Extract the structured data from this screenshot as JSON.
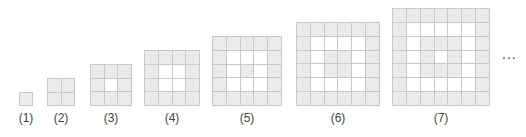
{
  "figures": [
    {
      "label": "(1)",
      "n": 1,
      "left": 19,
      "top": 92
    },
    {
      "label": "(2)",
      "n": 2,
      "left": 47,
      "top": 78
    },
    {
      "label": "(3)",
      "n": 3,
      "left": 90,
      "top": 64
    },
    {
      "label": "(4)",
      "n": 4,
      "left": 144,
      "top": 50
    },
    {
      "label": "(5)",
      "n": 5,
      "left": 212,
      "top": 36
    },
    {
      "label": "(6)",
      "n": 6,
      "left": 296,
      "top": 22
    },
    {
      "label": "(7)",
      "n": 7,
      "left": 392,
      "top": 8
    }
  ],
  "cell_size": 14,
  "pattern": "concentric rings alternating gray/white starting with gray outer ring",
  "colors": {
    "gray_cell": "#ebebeb",
    "white_cell": "#ffffff",
    "grid_line": "#c8c8c8"
  },
  "ellipsis": "..."
}
